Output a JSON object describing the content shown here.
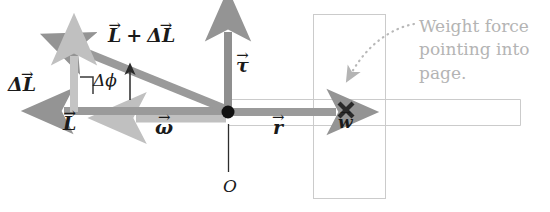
{
  "figure": {
    "kind": "physics-vector-diagram",
    "background_color": "#ffffff"
  },
  "colors": {
    "vector_gray": "#949494",
    "vector_gray_dark": "#8a8a8a",
    "vector_light": "#c4c4c4",
    "outline_gray": "#c9c9c9",
    "annotation_gray": "#b4b4b4",
    "label_black": "#1a1a1a",
    "pivot_black": "#111111"
  },
  "labels": {
    "L_plus_deltaL": "L + ΔL",
    "L_plus_deltaL_base_1": "L",
    "L_plus_deltaL_plus": "+",
    "L_plus_deltaL_base_2": "ΔL",
    "delta_L": "ΔL",
    "delta_L_base": "L",
    "delta_L_prefix": "Δ",
    "L": "L",
    "delta_phi": "Δϕ",
    "tau": "τ",
    "omega": "ω",
    "r": "r",
    "w": "w",
    "origin": "O"
  },
  "annotation": {
    "text": "Weight force pointing into page.",
    "line_1": "Weight force",
    "line_2": "pointing into",
    "line_3": "page.",
    "color": "#b4b4b4",
    "pointer": "dotted-curved-arrow"
  },
  "markers": {
    "into_page_symbol": "×",
    "pivot_symbol": "•",
    "right_angle": "⌐"
  },
  "geometry": {
    "pivot_point": {
      "x": 228,
      "y": 112
    },
    "vectors": [
      {
        "name": "L",
        "from": [
          228,
          112
        ],
        "to": [
          55,
          112
        ],
        "style": "thick-gray"
      },
      {
        "name": "L+dL",
        "from": [
          228,
          112
        ],
        "to": [
          72,
          48
        ],
        "style": "thick-gray"
      },
      {
        "name": "dL",
        "from": [
          74,
          112
        ],
        "to": [
          74,
          48
        ],
        "style": "thick-light"
      },
      {
        "name": "tau",
        "from": [
          228,
          112
        ],
        "to": [
          228,
          22
        ],
        "style": "thick-gray"
      },
      {
        "name": "omega",
        "from": [
          228,
          118
        ],
        "to": [
          128,
          118
        ],
        "style": "thick-light"
      },
      {
        "name": "r",
        "from": [
          228,
          112
        ],
        "to": [
          345,
          112
        ],
        "style": "thick-gray"
      }
    ],
    "disk_rect": {
      "x": 313,
      "y": 14,
      "w": 72,
      "h": 184
    },
    "axle_rect": {
      "x": 228,
      "y": 99,
      "w": 292,
      "h": 26
    },
    "origin_line": {
      "x": 228,
      "y1": 122,
      "y2": 172
    }
  }
}
